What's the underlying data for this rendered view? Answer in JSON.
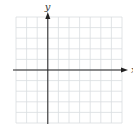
{
  "diagram": {
    "type": "coordinate-grid",
    "grid": {
      "left": 16,
      "top": 17,
      "cell_size": 10.6,
      "columns": 10,
      "rows": 10,
      "line_color": "#d9dde0"
    },
    "axes": {
      "color": "#222222",
      "x_axis_row_index": 5,
      "y_axis_col_index": 3,
      "x_label": "x",
      "y_label": "y"
    }
  }
}
